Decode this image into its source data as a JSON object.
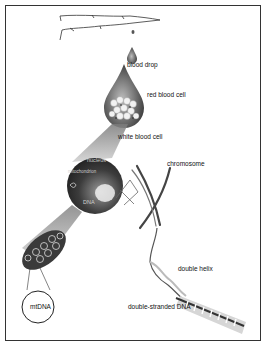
{
  "diagram": {
    "labels": {
      "blood_drop": "blood drop",
      "red_blood_cell": "red blood cell",
      "white_blood_cell": "white blood cell",
      "nucleus": "nucleus",
      "mitochondrion": "mitochondrion",
      "dna_in_nucleus": "DNA",
      "chromosome": "chromosome",
      "double_helix": "double helix",
      "double_stranded_dna": "double-stranded DNA",
      "mtdna": "mtDNA"
    },
    "icons": [
      "finger-icon",
      "blood-drop-icon",
      "large-drop-icon",
      "cell-icon",
      "mitochondrion-icon",
      "mtdna-circle-icon",
      "chromosome-icon",
      "dna-helix-icon"
    ],
    "colors": {
      "outline": "#333333",
      "dark_fill": "#3a3a3a",
      "mid_gray": "#8a8a8a",
      "light_gray": "#d8d8d8"
    }
  }
}
